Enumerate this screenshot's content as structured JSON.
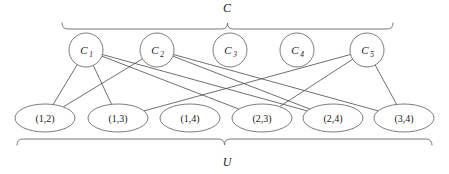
{
  "figure": {
    "kind": "bipartite-set-cover-diagram",
    "top_set_label": "C",
    "bottom_set_label": "U"
  },
  "top_nodes": [
    {
      "id": "c1",
      "label": "C",
      "subscript": "1",
      "cx": 86,
      "cy": 50,
      "r": 17
    },
    {
      "id": "c2",
      "label": "C",
      "subscript": "2",
      "cx": 157,
      "cy": 50,
      "r": 17
    },
    {
      "id": "c3",
      "label": "C",
      "subscript": "3",
      "cx": 230,
      "cy": 50,
      "r": 17
    },
    {
      "id": "c4",
      "label": "C",
      "subscript": "4",
      "cx": 297,
      "cy": 50,
      "r": 17
    },
    {
      "id": "c5",
      "label": "C",
      "subscript": "5",
      "cx": 367,
      "cy": 50,
      "r": 17
    }
  ],
  "bottom_nodes": [
    {
      "id": "u12",
      "label": "(1,2)",
      "cx": 45,
      "cy": 118,
      "rx": 30,
      "ry": 14
    },
    {
      "id": "u13",
      "label": "(1,3)",
      "cx": 118,
      "cy": 118,
      "rx": 30,
      "ry": 14
    },
    {
      "id": "u14",
      "label": "(1,4)",
      "cx": 190,
      "cy": 118,
      "rx": 30,
      "ry": 14
    },
    {
      "id": "u23",
      "label": "(2,3)",
      "cx": 262,
      "cy": 118,
      "rx": 30,
      "ry": 14
    },
    {
      "id": "u24",
      "label": "(2,4)",
      "cx": 333,
      "cy": 118,
      "rx": 30,
      "ry": 14
    },
    {
      "id": "u34",
      "label": "(3,4)",
      "cx": 404,
      "cy": 118,
      "rx": 30,
      "ry": 14
    }
  ],
  "edges": [
    {
      "from": "c1",
      "to": "u12"
    },
    {
      "from": "c1",
      "to": "u13"
    },
    {
      "from": "c1",
      "to": "u23"
    },
    {
      "from": "c1",
      "to": "u24"
    },
    {
      "from": "c2",
      "to": "u12"
    },
    {
      "from": "c2",
      "to": "u24"
    },
    {
      "from": "c2",
      "to": "u34"
    },
    {
      "from": "c5",
      "to": "u13"
    },
    {
      "from": "c5",
      "to": "u23"
    },
    {
      "from": "c5",
      "to": "u34"
    }
  ],
  "braces": {
    "top": {
      "x_start": 62,
      "x_end": 393,
      "y": 29,
      "label_x": 227,
      "label_y": 12
    },
    "bottom": {
      "x_start": 17,
      "x_end": 432,
      "y": 139,
      "label_x": 227,
      "label_y": 166
    }
  },
  "colors": {
    "stroke": "#5a5a5a",
    "edge": "#4a4a4a",
    "text": "#1a1a1a",
    "background": "#ffffff"
  }
}
